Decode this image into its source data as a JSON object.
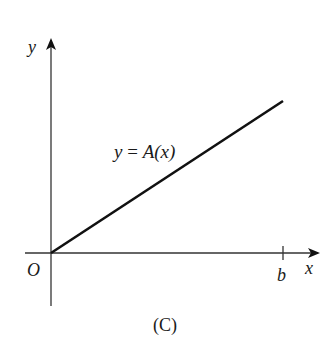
{
  "figure": {
    "caption": "(C)",
    "axes": {
      "x_label": "x",
      "y_label": "y",
      "origin_label": "O",
      "x_tick_label": "b"
    },
    "curve": {
      "label_lhs": "y",
      "label_eq": " = ",
      "label_rhs": "A(x)",
      "description": "straight line through origin with positive slope"
    },
    "colors": {
      "axis": "#333333",
      "curve": "#111111",
      "text": "#1a1a1a"
    },
    "geometry": {
      "origin": [
        51,
        253
      ],
      "x_axis_start": 25,
      "x_axis_end": 318,
      "y_axis_top": 40,
      "y_axis_bottom": 306,
      "line_end": [
        283,
        101
      ],
      "b_tick_x": 283
    }
  }
}
